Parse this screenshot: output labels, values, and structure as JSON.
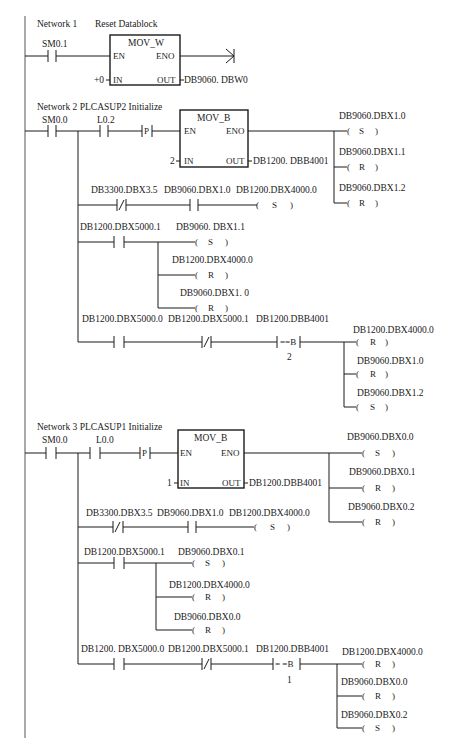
{
  "diagram": {
    "type": "ladder-logic",
    "colors": {
      "line": "#1a1a1a",
      "background": "#ffffff"
    },
    "networks": [
      {
        "id": 1,
        "title": "Network 1",
        "comment": "Reset Datablock",
        "contacts": [
          {
            "address": "SM0.1",
            "type": "NO"
          }
        ],
        "block": {
          "name": "MOV_W",
          "en": "EN",
          "eno": "ENO",
          "in_label": "IN",
          "out_label": "OUT",
          "in_value": "+0",
          "out_value": "DB9060. DBW0"
        },
        "end_symbol": "arrow"
      },
      {
        "id": 2,
        "title": "Network 2 PLCASUP2 Initialize",
        "contacts": [
          {
            "address": "SM0.0",
            "type": "NO"
          },
          {
            "address": "L0.2",
            "type": "NO"
          },
          {
            "address": "P",
            "type": "positive-edge"
          }
        ],
        "block": {
          "name": "MOV_B",
          "en": "EN",
          "eno": "ENO",
          "in_label": "IN",
          "out_label": "OUT",
          "in_value": "2",
          "out_value": "DB1200. DBB4001"
        },
        "block_coils": [
          {
            "address": "DB9060.DBX1.0",
            "op": "S"
          },
          {
            "address": "DB9060.DBX1.1",
            "op": "R"
          },
          {
            "address": "DB9060.DBX1.2",
            "op": "R"
          }
        ],
        "branch1": {
          "contacts": [
            {
              "address": "DB3300.DBX3.5",
              "type": "NC"
            },
            {
              "address": "DB9060.DBX1.0",
              "type": "NO"
            }
          ],
          "coil": {
            "address": "DB1200.DBX4000.0",
            "op": "S"
          }
        },
        "branch2": {
          "contacts": [
            {
              "address": "DB1200.DBX5000.1",
              "type": "NO"
            }
          ],
          "coils": [
            {
              "address": "DB9060. DBX1.1",
              "op": "S"
            },
            {
              "address": "DB1200.DBX4000.0",
              "op": "R"
            },
            {
              "address": "DB9060.DBX1. 0",
              "op": "R"
            }
          ]
        },
        "branch3": {
          "contacts": [
            {
              "address": "DB1200.DBX5000.0",
              "type": "NO"
            },
            {
              "address": "DB1200.DBX5000.1",
              "type": "NC"
            }
          ],
          "compare": {
            "address": "DB1200.DBB4001",
            "op": "==B",
            "value": "2"
          },
          "coils": [
            {
              "address": "DB1200.DBX4000.0",
              "op": "R"
            },
            {
              "address": "DB9060.DBX1.0",
              "op": "R"
            },
            {
              "address": "DB9060.DBX1.2",
              "op": "S"
            }
          ]
        }
      },
      {
        "id": 3,
        "title": "Network 3  PLCASUP1 Initialize",
        "contacts": [
          {
            "address": "SM0.0",
            "type": "NO"
          },
          {
            "address": "L0.0",
            "type": "NO"
          },
          {
            "address": "P",
            "type": "positive-edge"
          }
        ],
        "block": {
          "name": "MOV_B",
          "en": "EN",
          "eno": "ENO",
          "in_label": "IN",
          "out_label": "OUT",
          "in_value": "1",
          "out_value": "DB1200.DBB4001"
        },
        "block_coils": [
          {
            "address": "DB9060.DBX0.0",
            "op": "S"
          },
          {
            "address": "DB9060.DBX0.1",
            "op": "R"
          },
          {
            "address": "DB9060.DBX0.2",
            "op": "R"
          }
        ],
        "branch1": {
          "contacts": [
            {
              "address": "DB3300.DBX3.5",
              "type": "NC"
            },
            {
              "address": "DB9060.DBX1.0",
              "type": "NO"
            }
          ],
          "coil": {
            "address": "DB1200.DBX4000.0",
            "op": "S"
          }
        },
        "branch2": {
          "contacts": [
            {
              "address": "DB1200.DBX5000.1",
              "type": "NO"
            }
          ],
          "coils": [
            {
              "address": "DB9060.DBX0.1",
              "op": "S"
            },
            {
              "address": "DB1200.DBX4000.0",
              "op": "R"
            },
            {
              "address": "DB9060.DBX0.0",
              "op": "R"
            }
          ]
        },
        "branch3": {
          "contacts": [
            {
              "address": "DB1200. DBX5000.0",
              "type": "NO"
            },
            {
              "address": "DB1200.DBX5000.1",
              "type": "NC"
            }
          ],
          "compare": {
            "address": "DB1200.DBB4001",
            "op": "= =B",
            "value": "1"
          },
          "coils": [
            {
              "address": "DB1200.DBX4000.0",
              "op": "R"
            },
            {
              "address": "DB9060.DBX0.0",
              "op": "R"
            },
            {
              "address": "DB9060.DBX0.2",
              "op": "S"
            }
          ]
        }
      }
    ]
  }
}
